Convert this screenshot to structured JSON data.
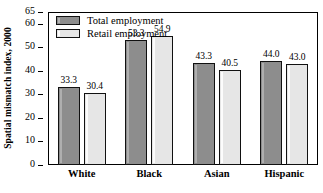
{
  "chart_data": {
    "type": "bar",
    "title": "",
    "xlabel": "",
    "ylabel": "Spatial mismatch index, 2000",
    "categories": [
      "White",
      "Black",
      "Asian",
      "Hispanic"
    ],
    "series": [
      {
        "name": "Total employment",
        "color": "#8d8d8d",
        "values": [
          33.3,
          53.3,
          43.3,
          44.0
        ]
      },
      {
        "name": "Retail employment",
        "color": "#e6e6e6",
        "values": [
          30.4,
          54.9,
          40.5,
          43.0
        ]
      }
    ],
    "value_labels": [
      [
        "33.3",
        "30.4"
      ],
      [
        "53.3",
        "54.9"
      ],
      [
        "43.3",
        "40.5"
      ],
      [
        "44.0",
        "43.0"
      ]
    ],
    "ylim": [
      0,
      65
    ],
    "yticks": [
      0,
      10,
      20,
      30,
      40,
      50,
      60,
      65
    ],
    "ytick_labels": [
      "0",
      "10",
      "20",
      "30",
      "40",
      "50",
      "60",
      "65"
    ],
    "grid": false,
    "legend_position": "top-left",
    "frame": true
  },
  "legend": {
    "items": [
      {
        "label": "Total employment",
        "swatch": "dark-gray-swatch"
      },
      {
        "label": "Retail employment",
        "swatch": "light-gray-swatch"
      }
    ]
  },
  "axis": {
    "y_title": "Spatial mismatch index, 2000"
  }
}
